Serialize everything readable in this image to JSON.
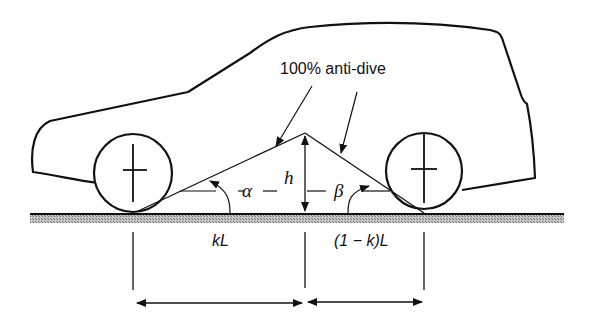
{
  "diagram": {
    "title_label": "100% anti-dive",
    "labels": {
      "height": "h",
      "front_angle": "α",
      "rear_angle": "β",
      "front_distance": "kL",
      "rear_distance": "(1 − k)L"
    },
    "colors": {
      "line": "#111111",
      "ground_fill": "#9a9a9a",
      "background": "#ffffff"
    }
  }
}
